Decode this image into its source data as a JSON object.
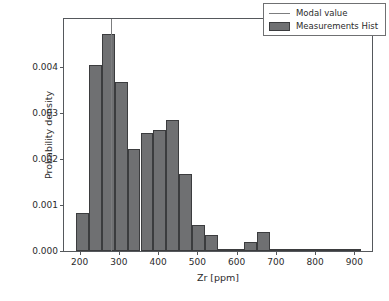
{
  "chart_data": {
    "type": "bar",
    "title": "",
    "xlabel": "Zr [ppm]",
    "ylabel": "Probability density",
    "xlim": [
      160,
      945
    ],
    "ylim": [
      0.0,
      0.00505
    ],
    "xticks": [
      200,
      300,
      400,
      500,
      600,
      700,
      800,
      900
    ],
    "xtick_labels": [
      "200",
      "300",
      "400",
      "500",
      "600",
      "700",
      "800",
      "900"
    ],
    "yticks": [
      0.0,
      0.001,
      0.002,
      0.003,
      0.004
    ],
    "ytick_labels": [
      "0.000",
      "0.001",
      "0.002",
      "0.003",
      "0.004"
    ],
    "grid": false,
    "legend_position": "upper right",
    "legend": [
      "Modal value",
      "Measurements Hist"
    ],
    "bin_width": 33,
    "bin_edges": [
      190,
      223,
      256,
      289,
      322,
      355,
      388,
      421,
      454,
      487,
      520,
      553,
      586,
      619,
      652,
      685,
      718,
      751,
      784,
      817,
      850,
      883,
      916
    ],
    "values": [
      0.00082,
      0.00405,
      0.00472,
      0.00367,
      0.00221,
      0.00256,
      0.00264,
      0.00285,
      0.00167,
      0.00057,
      0.00034,
      4e-05,
      4e-05,
      0.0002,
      0.00042,
      4e-05,
      4e-05,
      0.0,
      0.0,
      4e-05,
      4e-05,
      0.0
    ],
    "modal_value": 280,
    "series": [
      {
        "name": "Measurements Hist",
        "type": "bar",
        "color": "#6f7072",
        "edge_color": "#3b3c3e"
      },
      {
        "name": "Modal value",
        "type": "vline",
        "color": "#7c7d7f",
        "x": 280
      }
    ]
  }
}
